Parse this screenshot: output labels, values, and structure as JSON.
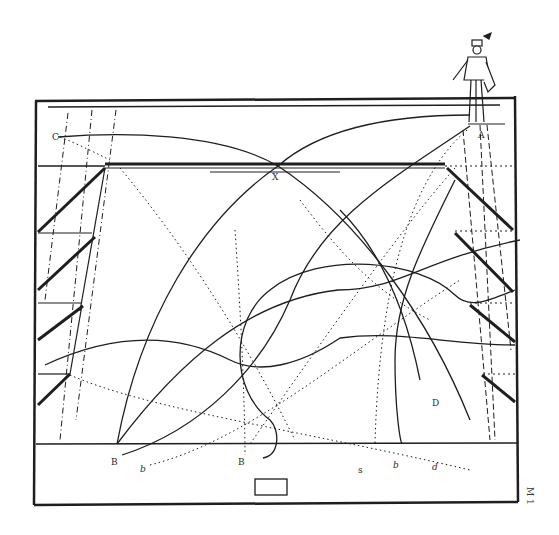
{
  "diagram": {
    "type": "engraving-geometric-projection",
    "colors": {
      "ink": "#1e1e1e",
      "paper": "#ffffff"
    },
    "labels": {
      "C": "C",
      "X": "X",
      "A": "A",
      "D": "D",
      "B1": "B",
      "B2": "B",
      "b1": "b",
      "b2": "b",
      "s": "s",
      "d": "d",
      "side_mark": "M 1"
    }
  }
}
